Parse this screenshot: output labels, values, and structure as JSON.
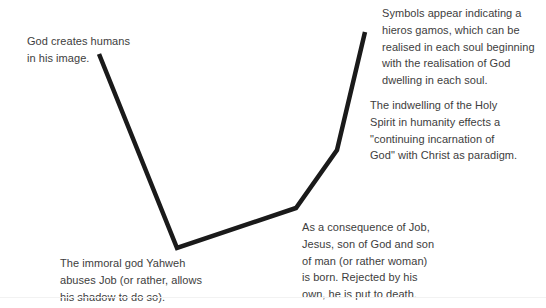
{
  "diagram": {
    "background_color": "#ffffff",
    "text_color": "#3d3d3d",
    "line_color": "#1a1a1a",
    "line_width": 4.5,
    "labels": {
      "creation": "God creates humans\nin his image.",
      "hieros_gamos": "Symbols appear indicating a\nhieros gamos, which can be\nrealised in each soul beginning\nwith the realisation of God\ndwelling in each soul.",
      "indwelling": "The indwelling of the Holy\nSpirit in humanity effects a\n\"continuing incarnation of\nGod\" with Christ as paradigm.",
      "yahweh": "The immoral god Yahweh\nabuses Job (or rather, allows\nhis shadow to do so).",
      "jesus": "As a consequence of Job,\nJesus, son of God and son\nof man (or rather woman)\nis born.  Rejected by his\nown, he is put to death."
    }
  },
  "chart_data": {
    "type": "line",
    "title": "",
    "xlabel": "",
    "ylabel": "",
    "grid": false,
    "legend_position": "none",
    "xlim": [
      0,
      546
    ],
    "ylim": [
      308,
      0
    ],
    "series": [
      {
        "name": "salvation-history-curve",
        "points": [
          {
            "x": 99,
            "y": 54
          },
          {
            "x": 177,
            "y": 248
          },
          {
            "x": 296,
            "y": 208
          },
          {
            "x": 337,
            "y": 150
          },
          {
            "x": 365,
            "y": 32
          }
        ]
      }
    ],
    "annotations": [
      {
        "text": "God creates humans in his image.",
        "x": 99,
        "y": 54
      },
      {
        "text": "The immoral god Yahweh abuses Job (or rather, allows his shadow to do so).",
        "x": 177,
        "y": 248
      },
      {
        "text": "As a consequence of Job, Jesus, son of God and son of man (or rather woman) is born.  Rejected by his own, he is put to death.",
        "x": 296,
        "y": 208
      },
      {
        "text": "The indwelling of the Holy Spirit in humanity effects a \"continuing incarnation of God\" with Christ as paradigm.",
        "x": 337,
        "y": 150
      },
      {
        "text": "Symbols appear indicating a hieros gamos, which can be realised in each soul beginning with the realisation of God dwelling in each soul.",
        "x": 365,
        "y": 32
      }
    ]
  }
}
